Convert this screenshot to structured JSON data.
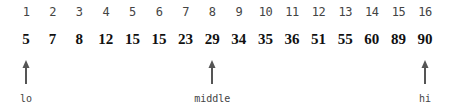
{
  "diagram": {
    "type": "binary-search-array",
    "indices": [
      "1",
      "2",
      "3",
      "4",
      "5",
      "6",
      "7",
      "8",
      "9",
      "10",
      "11",
      "12",
      "13",
      "14",
      "15",
      "16"
    ],
    "values": [
      "5",
      "7",
      "8",
      "12",
      "15",
      "15",
      "23",
      "29",
      "34",
      "35",
      "36",
      "51",
      "55",
      "60",
      "89",
      "90"
    ],
    "pointers": [
      {
        "label": "lo",
        "index": 1
      },
      {
        "label": "middle",
        "index": 8
      },
      {
        "label": "hi",
        "index": 16
      }
    ],
    "colors": {
      "text": "#111111",
      "index_text": "#444444",
      "arrow": "#555555"
    }
  }
}
